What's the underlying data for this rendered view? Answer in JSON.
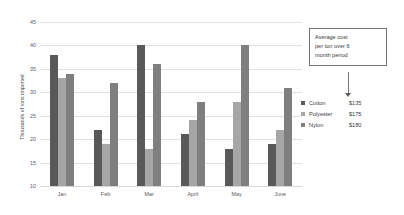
{
  "chart_data": {
    "type": "bar",
    "title": "",
    "xlabel": "",
    "ylabel": "Thousands of tons imported",
    "categories": [
      "Jan",
      "Feb",
      "Mar",
      "April",
      "May",
      "June"
    ],
    "series": [
      {
        "name": "Cotton",
        "price": "$135",
        "color": "#595959",
        "values": [
          38,
          22,
          40,
          21,
          18,
          19
        ]
      },
      {
        "name": "Polyester",
        "price": "$175",
        "color": "#a6a6a6",
        "values": [
          33,
          19,
          18,
          24,
          28,
          22
        ]
      },
      {
        "name": "Nylon",
        "price": "$180",
        "color": "#7f7f7f",
        "values": [
          34,
          32,
          36,
          28,
          40,
          31
        ]
      }
    ],
    "ylim": [
      10,
      45
    ],
    "yticks": [
      10,
      15,
      20,
      25,
      30,
      35,
      40,
      45
    ],
    "grid": "horizontal",
    "legend_position": "right",
    "annotations": [
      {
        "text": "Average cost per ton over 6 month period",
        "target": "legend"
      }
    ]
  },
  "callout": {
    "line1": "Average cost",
    "line2": "per ton over 6",
    "line3": "month period"
  },
  "colors": {
    "gridline": "#e2e2e2",
    "text": "#3f3f3f",
    "callout_border": "#777777"
  }
}
